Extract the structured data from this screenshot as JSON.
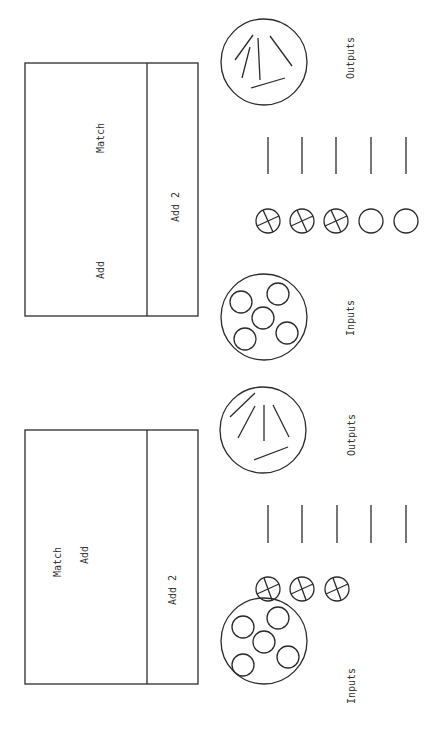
{
  "panels": [
    {
      "id": "top",
      "box": {
        "match_label": "Match",
        "add_label": "Add",
        "add2_label": "Add 2"
      },
      "outputs_label": "Outputs",
      "inputs_label": "Inputs",
      "output_lines_count": 5,
      "slots": [
        {
          "state": "crossed"
        },
        {
          "state": "crossed"
        },
        {
          "state": "crossed"
        },
        {
          "state": "empty"
        },
        {
          "state": "empty"
        }
      ]
    },
    {
      "id": "bottom",
      "box": {
        "match_label": "Match",
        "add_label": "Add",
        "add2_label": "Add 2"
      },
      "outputs_label": "Outputs",
      "inputs_label": "Inputs",
      "output_lines_count": 5,
      "slots": [
        {
          "state": "crossed"
        },
        {
          "state": "crossed"
        },
        {
          "state": "crossed"
        }
      ]
    }
  ],
  "colors": {
    "ink": "#2b2b2b",
    "background": "#ffffff"
  }
}
